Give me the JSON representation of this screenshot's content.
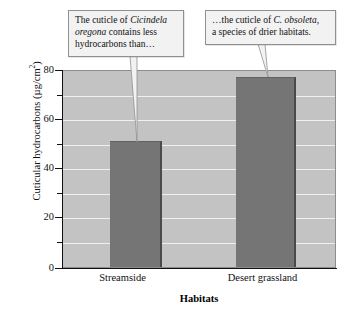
{
  "chart_data": {
    "type": "bar",
    "title": "",
    "categories": [
      "Streamside",
      "Desert grassland"
    ],
    "values": [
      51.5,
      77.5
    ],
    "xlabel": "Habitats",
    "ylabel": "Cuticular hydrocarbons (µg/cm²)",
    "ylabel_main": "Cuticular hydrocarbons (µg/cm",
    "ylabel_sup": "2",
    "ylabel_close": ")",
    "ylim": [
      0,
      80
    ],
    "ytick_labels": [
      "0",
      "20",
      "40",
      "60",
      "80"
    ],
    "ytick_values": [
      0,
      20,
      40,
      60,
      80
    ],
    "yminor_values": [
      10,
      30,
      50,
      70
    ],
    "grid": true,
    "grid_orientation": "horizontal",
    "legend": "none",
    "bar_color": "#757575",
    "plot_background": "#c3c3c3",
    "gridline_color": "#efefef",
    "annotations": [
      {
        "id": "callout-left",
        "text_parts": [
          {
            "text": "The cuticle of ",
            "style": "normal"
          },
          {
            "text": "Cicindela oregona",
            "style": "italic"
          },
          {
            "text": " contains less hydrocarbons than…",
            "style": "normal"
          }
        ],
        "points_to_category": "Streamside"
      },
      {
        "id": "callout-right",
        "text_parts": [
          {
            "text": "…the cuticle of ",
            "style": "normal"
          },
          {
            "text": "C. obsoleta,",
            "style": "italic"
          },
          {
            "text": " a species of drier habitats.",
            "style": "normal"
          }
        ],
        "points_to_category": "Desert grassland"
      }
    ]
  },
  "callouts": {
    "left": {
      "line1_a": "The cuticle of ",
      "line1_b": "Cicindela",
      "line2_a": "oregona",
      "line2_b": " contains less",
      "line3": "hydrocarbons than…"
    },
    "right": {
      "line1_a": "…the cuticle of ",
      "line1_b": "C. obsoleta,",
      "line2": "a species of drier habitats."
    }
  },
  "axis": {
    "x_title": "Habitats",
    "x_labels": [
      "Streamside",
      "Desert grassland"
    ],
    "y_title_main": "Cuticular hydrocarbons (µg/cm",
    "y_title_sup": "2",
    "y_title_end": ")",
    "y_ticks": [
      "80",
      "60",
      "40",
      "20",
      "0"
    ]
  }
}
